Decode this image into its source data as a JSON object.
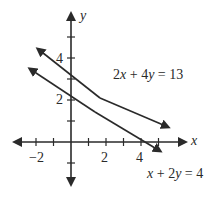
{
  "diagram": {
    "type": "coordinate-plane",
    "axes": {
      "x_label": "x",
      "y_label": "y",
      "x_tick_labels": [
        "−2",
        "2",
        "4"
      ],
      "y_tick_labels": [
        "2",
        "4"
      ]
    },
    "lines": [
      {
        "equation": "2x + 4y = 13",
        "eq_parts": {
          "a": "2",
          "v1": "x",
          "op": " + ",
          "b": "4",
          "v2": "y",
          "rhs": " = 13"
        }
      },
      {
        "equation": "x + 2y = 4",
        "eq_parts": {
          "a": "",
          "v1": "x",
          "op": " + ",
          "b": "2",
          "v2": "y",
          "rhs": " = 4"
        }
      }
    ],
    "colors": {
      "ink": "#2a2a2a",
      "background": "#ffffff"
    }
  }
}
